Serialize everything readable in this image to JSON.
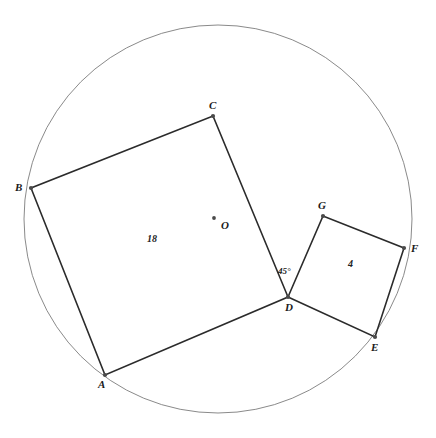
{
  "figure": {
    "canvas": {
      "width": 436,
      "height": 438
    },
    "colors": {
      "background": "#ffffff",
      "circle_stroke": "#8a8a8a",
      "polygon_stroke": "#2b2b2b",
      "vertex_fill": "#4a4a4a",
      "label_text": "#1a1a1a"
    },
    "circle": {
      "name": "circumscribed-circle",
      "center_x": 218,
      "center_y": 219,
      "radius": 194,
      "stroke_width": 1
    },
    "center_point": {
      "name": "center-O",
      "label": "O",
      "x": 214,
      "y": 218,
      "label_x": 221,
      "label_y": 220
    },
    "points": [
      {
        "id": "A",
        "label": "A",
        "x": 105,
        "y": 375,
        "label_x": 98,
        "label_y": 379
      },
      {
        "id": "B",
        "label": "B",
        "x": 31,
        "y": 188,
        "label_x": 15,
        "label_y": 182
      },
      {
        "id": "C",
        "label": "C",
        "x": 213,
        "y": 116,
        "label_x": 209,
        "label_y": 100
      },
      {
        "id": "D",
        "label": "D",
        "x": 288,
        "y": 297,
        "label_x": 285,
        "label_y": 302
      },
      {
        "id": "E",
        "label": "E",
        "x": 375,
        "y": 337,
        "label_x": 371,
        "label_y": 342
      },
      {
        "id": "F",
        "label": "F",
        "x": 404,
        "y": 248,
        "label_x": 411,
        "label_y": 243
      },
      {
        "id": "G",
        "label": "G",
        "x": 323,
        "y": 216,
        "label_x": 318,
        "label_y": 200
      }
    ],
    "polygons": [
      {
        "name": "large-square-ABCD",
        "vertices": [
          "A",
          "B",
          "C",
          "D"
        ],
        "area_label": "18",
        "area_label_x": 147,
        "area_label_y": 234
      },
      {
        "name": "small-square-DEFG",
        "vertices": [
          "D",
          "E",
          "F",
          "G"
        ],
        "area_label": "4",
        "area_label_x": 348,
        "area_label_y": 259
      }
    ],
    "angle_markers": [
      {
        "name": "angle-CDG",
        "label": "45°",
        "at_point": "D",
        "label_x": 278,
        "label_y": 267
      }
    ]
  }
}
